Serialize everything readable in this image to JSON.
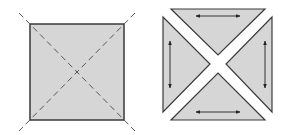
{
  "figure": {
    "width": 285,
    "height": 135,
    "colors": {
      "fill": "#d6d6d6",
      "stroke": "#3a3a3a",
      "dash": "#555555",
      "arrow": "#222222",
      "background": "#ffffff"
    },
    "left_panel": {
      "description": "square with dashed diagonals extending beyond corners",
      "square": {
        "x": 30,
        "y": 24,
        "w": 94,
        "h": 96
      },
      "diagonals": [
        {
          "x1": 19,
          "y1": 13,
          "x2": 135,
          "y2": 131
        },
        {
          "x1": 135,
          "y1": 13,
          "x2": 19,
          "y2": 131
        }
      ]
    },
    "right_panel": {
      "description": "square cut along diagonals into four separated triangles with double-headed arrows",
      "triangles": [
        {
          "name": "top",
          "points": "171,9 265,9 218,55"
        },
        {
          "name": "left",
          "points": "163,17 163,112 210,64"
        },
        {
          "name": "right",
          "points": "272,17 272,112 226,64"
        },
        {
          "name": "bottom",
          "points": "171,120 265,120 218,73"
        }
      ],
      "arrows": [
        {
          "name": "top",
          "x1": 196,
          "y1": 16,
          "x2": 240,
          "y2": 16
        },
        {
          "name": "left",
          "x1": 170,
          "y1": 41,
          "x2": 170,
          "y2": 88
        },
        {
          "name": "right",
          "x1": 265,
          "y1": 41,
          "x2": 265,
          "y2": 88
        },
        {
          "name": "bottom",
          "x1": 196,
          "y1": 112,
          "x2": 240,
          "y2": 112
        }
      ]
    }
  }
}
